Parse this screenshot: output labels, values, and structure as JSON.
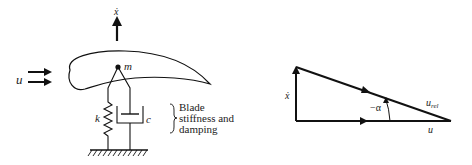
{
  "left_diagram": {
    "velocity_label": "ẋ",
    "flow_label": "u",
    "mass_label": "m",
    "spring_label": "k",
    "damper_label": "c",
    "annotation_lines": [
      "Blade",
      "stiffness and",
      "damping"
    ]
  },
  "right_diagram": {
    "vertical_label": "ẋ",
    "angle_label": "−α",
    "hypotenuse_label": "u",
    "hypotenuse_subscript": "rel",
    "base_label": "u"
  }
}
